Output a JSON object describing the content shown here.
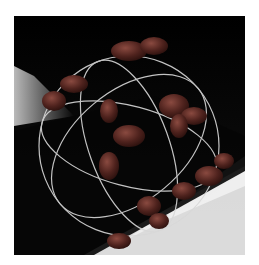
{
  "image": {
    "subject": "3D render of red-brown molecular blobs arranged on a silver wire sphere against a dark background",
    "colors": {
      "background": "#0a0a0a",
      "highlight": "#ffffff",
      "molecule": "#5a2a24",
      "wire": "#d8d8d8"
    }
  }
}
